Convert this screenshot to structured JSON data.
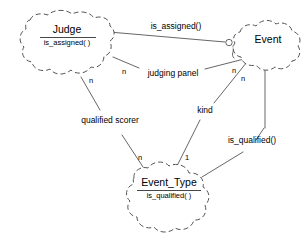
{
  "diagram": {
    "kind": "entity-relationship-diagram",
    "entities": [
      {
        "id": "judge",
        "name": "Judge",
        "method": "is_assigned( )"
      },
      {
        "id": "event",
        "name": "Event",
        "method": ""
      },
      {
        "id": "event_type",
        "name": "Event_Type",
        "method": "is_qualified( )"
      }
    ],
    "relationships": [
      {
        "id": "is-assigned",
        "label": "is_assigned()",
        "from": "judge",
        "to": "event",
        "from_cardinality": "",
        "to_cardinality": ""
      },
      {
        "id": "judging-panel",
        "label": "judging panel",
        "from": "judge",
        "to": "event",
        "from_cardinality": "n",
        "to_cardinality": "n"
      },
      {
        "id": "qualified-scorer",
        "label": "qualified scorer",
        "from": "judge",
        "to": "event_type",
        "from_cardinality": "n",
        "to_cardinality": "n"
      },
      {
        "id": "kind",
        "label": "kind",
        "from": "event",
        "to": "event_type",
        "from_cardinality": "n",
        "to_cardinality": "1"
      },
      {
        "id": "is-qualified",
        "label": "is_qualified()",
        "from": "event",
        "to": "event_type",
        "from_cardinality": "",
        "to_cardinality": ""
      }
    ],
    "colors": {
      "background": "#ffffff",
      "outline": "#555555",
      "text": "#000000",
      "line": "#555555"
    }
  }
}
